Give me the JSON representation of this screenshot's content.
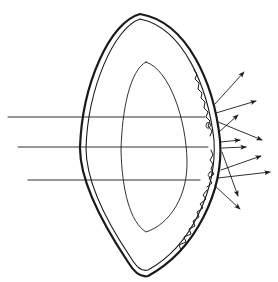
{
  "figure": {
    "width": 278,
    "height": 282,
    "background": "#ffffff",
    "ink": "#1a1a1a",
    "incident_rays": [
      {
        "x1": 8,
        "y1": 117,
        "x2": 205,
        "y2": 117
      },
      {
        "x1": 18,
        "y1": 147,
        "x2": 208,
        "y2": 147
      },
      {
        "x1": 28,
        "y1": 180,
        "x2": 200,
        "y2": 180
      }
    ],
    "scattered_rays": [
      {
        "x1": 215,
        "y1": 104,
        "x2": 244,
        "y2": 72
      },
      {
        "x1": 216,
        "y1": 113,
        "x2": 256,
        "y2": 101
      },
      {
        "x1": 219,
        "y1": 132,
        "x2": 238,
        "y2": 115
      },
      {
        "x1": 218,
        "y1": 122,
        "x2": 262,
        "y2": 140
      },
      {
        "x1": 221,
        "y1": 142,
        "x2": 240,
        "y2": 140
      },
      {
        "x1": 222,
        "y1": 148,
        "x2": 246,
        "y2": 147
      },
      {
        "x1": 221,
        "y1": 170,
        "x2": 261,
        "y2": 156
      },
      {
        "x1": 218,
        "y1": 178,
        "x2": 270,
        "y2": 172
      },
      {
        "x1": 222,
        "y1": 152,
        "x2": 238,
        "y2": 196
      },
      {
        "x1": 215,
        "y1": 186,
        "x2": 240,
        "y2": 209
      }
    ]
  }
}
